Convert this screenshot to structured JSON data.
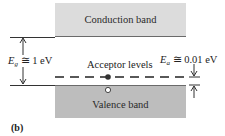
{
  "diagram": {
    "panel_label": "(b)",
    "conduction_band": {
      "label": "Conduction band",
      "color": "#dcdcdc"
    },
    "valence_band": {
      "label": "Valence band",
      "color": "#bdbdbd"
    },
    "acceptor_levels": {
      "label": "Acceptor levels"
    },
    "band_gap": {
      "symbol": "E",
      "subscript": "g",
      "relation": "≅ 1 eV"
    },
    "acceptor_energy": {
      "symbol": "E",
      "subscript": "a",
      "relation": "≅ 0.01 eV"
    }
  }
}
